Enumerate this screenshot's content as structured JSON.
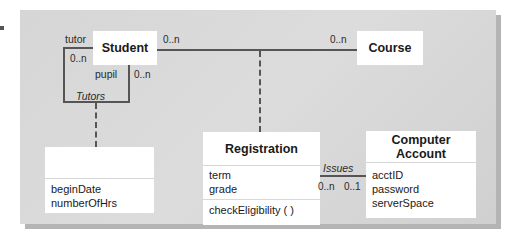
{
  "diagram": {
    "type": "UML class diagram",
    "classes": {
      "student": {
        "name": "Student"
      },
      "course": {
        "name": "Course"
      },
      "tutors_class": {
        "name": "",
        "attributes": [
          "beginDate",
          "numberOfHrs"
        ]
      },
      "registration": {
        "name": "Registration",
        "attributes": [
          "term",
          "grade"
        ],
        "operations": [
          "checkEligibility ( )"
        ]
      },
      "computer_account": {
        "name": "Computer Account",
        "attributes": [
          "acctID",
          "password",
          "serverSpace"
        ]
      }
    },
    "associations": {
      "tutors": {
        "name": "Tutors",
        "role_a": "tutor",
        "mult_a": "0..n",
        "role_b": "pupil",
        "mult_b": "0..n"
      },
      "student_course": {
        "mult_student": "0..n",
        "mult_course": "0..n"
      },
      "issues": {
        "name": "Issues",
        "mult_registration": "0..n",
        "mult_account": "0..1"
      }
    },
    "colors": {
      "panel": "#d6d6d6",
      "shadow": "#b4b4b4",
      "box": "#ffffff",
      "line": "#555555"
    }
  }
}
